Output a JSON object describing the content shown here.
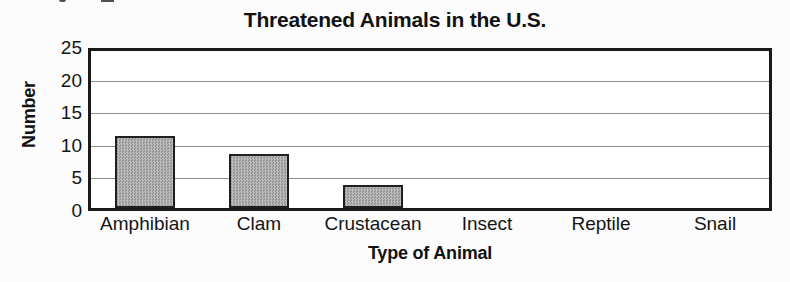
{
  "chart_data": {
    "type": "bar",
    "title": "Threatened Animals in the U.S.",
    "xlabel": "Type of Animal",
    "ylabel": "Number",
    "categories": [
      "Amphibian",
      "Clam",
      "Crustacean",
      "Insect",
      "Reptile",
      "Snail"
    ],
    "values": [
      11,
      8.3,
      3.5,
      0,
      0,
      0
    ],
    "ylim": [
      0,
      25
    ],
    "yticks": [
      0,
      5,
      10,
      15,
      20,
      25
    ],
    "ytick_labels": [
      "0",
      "5",
      "10",
      "15",
      "20",
      "25"
    ],
    "grid": true,
    "grid_axis": "y",
    "legend": false,
    "colors": {
      "bar_fill": "#a9a9a9",
      "bar_border": "#1f1f1f",
      "axis": "#1a1a1a",
      "gridline": "#8e8e8e",
      "text": "#111111",
      "background": "#ffffff"
    }
  }
}
